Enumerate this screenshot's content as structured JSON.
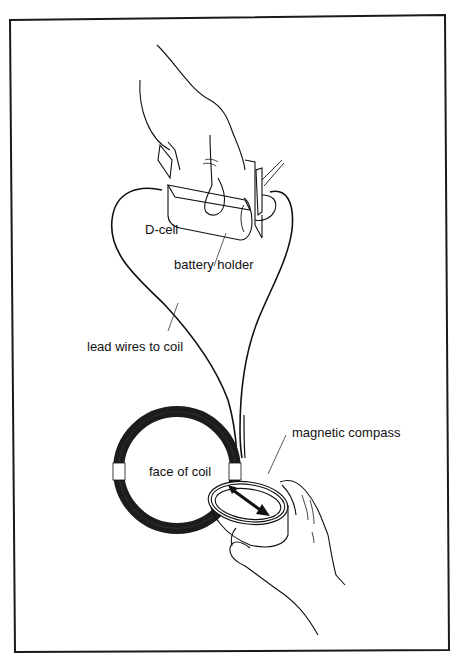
{
  "figure": {
    "type": "apparatus-illustration",
    "frame_color": "#1a1a1a",
    "line_color": "#111111",
    "coil_color": "#1c1c1c",
    "background": "#ffffff"
  },
  "labels": {
    "d_cell": "D-cell",
    "battery_holder": "battery holder",
    "lead_wires": "lead wires to coil",
    "face_of_coil": "face of coil",
    "magnetic_compass": "magnetic compass"
  },
  "components": [
    {
      "name": "hand-holding-battery",
      "description": "hand pressing D-cell into battery holder"
    },
    {
      "name": "d-cell",
      "label_ref": "d_cell"
    },
    {
      "name": "battery-holder",
      "label_ref": "battery_holder"
    },
    {
      "name": "lead-wires",
      "label_ref": "lead_wires"
    },
    {
      "name": "coil",
      "label_ref": "face_of_coil"
    },
    {
      "name": "compass",
      "label_ref": "magnetic_compass"
    },
    {
      "name": "hand-holding-compass",
      "description": "hand holding compass at edge of coil"
    }
  ]
}
